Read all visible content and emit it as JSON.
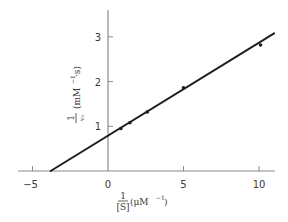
{
  "chart_data": {
    "type": "scatter",
    "title": "",
    "subtitle": "",
    "xlabel": "1/[S] (μM⁻¹)",
    "ylabel": "1/v₀ (mM⁻¹·s)",
    "xlabel_parts": {
      "num": "1",
      "den": "[S]",
      "unit": "(μM",
      "exp": "−1",
      "close": ")"
    },
    "ylabel_parts": {
      "num": "1",
      "den": "v₀",
      "unit": "(mM",
      "exp": "−1",
      "tail": "·s)"
    },
    "xlim": [
      -6,
      11.2
    ],
    "ylim": [
      0,
      3.6
    ],
    "x_ticks": [
      -5,
      0,
      5,
      10
    ],
    "x_tick_labels": [
      "−5",
      "0",
      "5",
      "10"
    ],
    "y_ticks": [
      1,
      2,
      3
    ],
    "y_tick_labels": [
      "1",
      "2",
      "3"
    ],
    "grid": false,
    "legend": null,
    "series": [
      {
        "name": "measured data",
        "kind": "points",
        "x": [
          0.85,
          1.45,
          2.6,
          5.0,
          10.1
        ],
        "y": [
          0.95,
          1.08,
          1.32,
          1.86,
          2.82
        ]
      },
      {
        "name": "linear fit (Lineweaver–Burk)",
        "kind": "line",
        "x": [
          -3.8,
          11.0
        ],
        "y": [
          0.0,
          3.08
        ],
        "y_intercept": 0.8,
        "x_intercept": -3.8,
        "slope": 0.21
      }
    ]
  },
  "colors": {
    "axis": "#8a8a8a",
    "line": "#1e1e1e",
    "point": "#1e1e1e",
    "text": "#3a3a3a",
    "background": "#ffffff"
  }
}
